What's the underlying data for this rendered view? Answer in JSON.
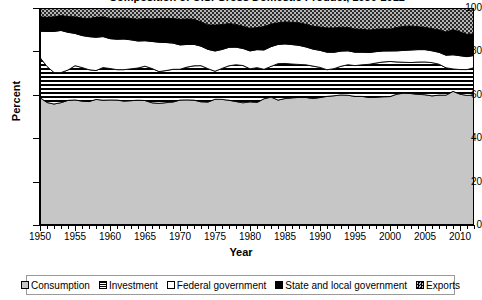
{
  "chart_data": {
    "type": "area",
    "stacked": true,
    "title": "Composition of U.S. Gross Domestic Product, 1950-2012",
    "xlabel": "Year",
    "ylabel": "Percent",
    "ylim": [
      0,
      100
    ],
    "yticks": [
      0,
      20,
      40,
      60,
      80,
      100
    ],
    "xlim": [
      1950,
      2012
    ],
    "xticks": [
      1950,
      1955,
      1960,
      1965,
      1970,
      1975,
      1980,
      1985,
      1990,
      1995,
      2000,
      2005,
      2010
    ],
    "minor_xtick_interval": 1,
    "grid": false,
    "legend_position": "bottom",
    "x": [
      1950,
      1951,
      1952,
      1953,
      1954,
      1955,
      1956,
      1957,
      1958,
      1959,
      1960,
      1961,
      1962,
      1963,
      1964,
      1965,
      1966,
      1967,
      1968,
      1969,
      1970,
      1971,
      1972,
      1973,
      1974,
      1975,
      1976,
      1977,
      1978,
      1979,
      1980,
      1981,
      1982,
      1983,
      1984,
      1985,
      1986,
      1987,
      1988,
      1989,
      1990,
      1991,
      1992,
      1993,
      1994,
      1995,
      1996,
      1997,
      1998,
      1999,
      2000,
      2001,
      2002,
      2003,
      2004,
      2005,
      2006,
      2007,
      2008,
      2009,
      2010,
      2011,
      2012
    ],
    "series": [
      {
        "name": "Consumption",
        "pattern": "light-gray-fill",
        "color": "#c6c6c6",
        "values": [
          62.0,
          60.4,
          60.0,
          61.0,
          61.5,
          62.0,
          61.2,
          61.2,
          61.8,
          62.0,
          62.0,
          61.6,
          61.5,
          61.7,
          62.0,
          61.6,
          60.6,
          60.5,
          61.0,
          61.0,
          61.6,
          61.8,
          61.8,
          60.7,
          61.2,
          62.0,
          62.4,
          62.2,
          61.8,
          61.6,
          62.0,
          61.2,
          62.6,
          63.6,
          62.4,
          63.4,
          64.0,
          64.2,
          64.2,
          64.0,
          64.4,
          64.6,
          64.8,
          65.2,
          65.4,
          65.2,
          65.2,
          64.8,
          65.0,
          65.6,
          65.8,
          66.0,
          66.6,
          67.0,
          67.2,
          67.6,
          67.6,
          68.0,
          68.2,
          68.0,
          68.0,
          68.2,
          68.4
        ]
      },
      {
        "name": "Investment",
        "pattern": "horizontal-stripes",
        "color": "#000000",
        "values": [
          19.5,
          17.8,
          15.6,
          15.0,
          15.0,
          17.0,
          16.6,
          15.8,
          14.2,
          16.2,
          15.6,
          15.0,
          15.6,
          15.8,
          16.0,
          17.0,
          17.0,
          15.8,
          16.0,
          16.2,
          15.2,
          16.2,
          17.0,
          17.8,
          16.6,
          13.8,
          15.4,
          17.2,
          18.4,
          18.8,
          16.6,
          17.4,
          14.6,
          15.2,
          18.2,
          17.6,
          17.0,
          16.6,
          16.4,
          16.4,
          15.2,
          13.4,
          13.6,
          14.4,
          15.4,
          15.6,
          16.0,
          16.8,
          17.4,
          17.8,
          18.0,
          16.2,
          15.6,
          15.8,
          16.6,
          17.0,
          17.4,
          16.2,
          14.4,
          11.4,
          12.8,
          13.6,
          14.4
        ]
      },
      {
        "name": "Federal government",
        "pattern": "white-fill",
        "color": "#ffffff",
        "values": [
          12.8,
          17.2,
          20.4,
          21.0,
          18.6,
          16.0,
          15.8,
          16.4,
          16.4,
          15.4,
          14.8,
          15.0,
          15.2,
          14.4,
          13.4,
          12.6,
          13.4,
          14.6,
          14.0,
          13.0,
          12.0,
          11.2,
          10.6,
          9.6,
          9.6,
          10.0,
          9.4,
          9.2,
          8.8,
          8.6,
          9.0,
          9.0,
          9.6,
          9.8,
          9.6,
          9.8,
          9.8,
          9.6,
          9.0,
          8.6,
          8.6,
          8.8,
          8.2,
          7.6,
          7.0,
          6.8,
          6.4,
          6.0,
          5.8,
          5.6,
          5.4,
          5.6,
          6.0,
          6.4,
          6.4,
          6.4,
          6.2,
          6.2,
          6.6,
          7.2,
          7.2,
          6.8,
          6.4
        ]
      },
      {
        "name": "State and local government",
        "pattern": "solid-black",
        "color": "#000000",
        "values": [
          7.0,
          7.0,
          7.2,
          7.4,
          7.8,
          8.2,
          8.6,
          9.0,
          9.8,
          9.8,
          10.0,
          10.4,
          10.4,
          10.6,
          10.8,
          11.0,
          11.2,
          11.8,
          12.0,
          12.2,
          12.6,
          12.6,
          12.4,
          12.0,
          12.2,
          12.8,
          12.4,
          11.8,
          11.4,
          11.2,
          11.4,
          11.0,
          11.6,
          11.2,
          10.8,
          11.0,
          11.2,
          11.4,
          11.4,
          11.6,
          11.8,
          12.2,
          12.2,
          12.0,
          11.8,
          11.8,
          11.6,
          11.4,
          11.4,
          11.4,
          11.2,
          11.8,
          12.2,
          12.2,
          11.8,
          11.6,
          11.6,
          11.8,
          12.2,
          12.8,
          12.4,
          11.8,
          11.4
        ]
      },
      {
        "name": "Exports",
        "pattern": "checkered-dots",
        "color": "#9e9e9e",
        "values": [
          4.3,
          4.6,
          4.4,
          3.8,
          4.2,
          4.4,
          5.0,
          5.2,
          4.6,
          4.4,
          5.2,
          5.0,
          5.0,
          5.2,
          5.6,
          5.2,
          5.4,
          5.2,
          5.2,
          5.2,
          5.6,
          5.4,
          5.6,
          6.8,
          8.4,
          8.4,
          8.2,
          7.8,
          8.2,
          9.2,
          10.2,
          9.8,
          9.2,
          8.0,
          7.4,
          7.0,
          7.2,
          7.4,
          8.2,
          9.2,
          9.6,
          10.0,
          10.0,
          9.6,
          9.8,
          10.6,
          10.8,
          11.2,
          10.8,
          10.6,
          10.8,
          9.8,
          9.2,
          9.2,
          9.6,
          10.0,
          10.8,
          11.4,
          12.6,
          11.0,
          12.4,
          13.8,
          13.6
        ]
      }
    ]
  },
  "axes": {
    "y": {
      "label": "Percent",
      "ticks": [
        "0",
        "20",
        "40",
        "60",
        "80",
        "100"
      ]
    },
    "x": {
      "label": "Year",
      "ticks": [
        "1950",
        "1955",
        "1960",
        "1965",
        "1970",
        "1975",
        "1980",
        "1985",
        "1990",
        "1995",
        "2000",
        "2005",
        "2010"
      ]
    }
  },
  "legend": {
    "items": [
      {
        "label": "Consumption",
        "swatch": "consumption-swatch"
      },
      {
        "label": "Investment",
        "swatch": "investment-swatch"
      },
      {
        "label": "Federal government",
        "swatch": "federal-government-swatch"
      },
      {
        "label": "State and local government",
        "swatch": "state-local-government-swatch"
      },
      {
        "label": "Exports",
        "swatch": "exports-swatch"
      }
    ]
  }
}
